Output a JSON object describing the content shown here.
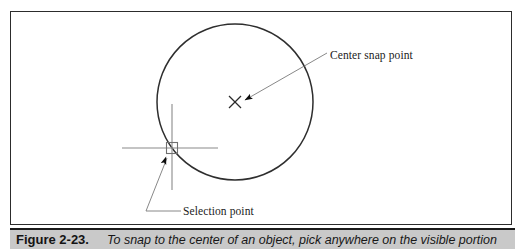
{
  "figure": {
    "frame": {
      "border_color": "#2c2c2c",
      "background": "#ffffff"
    },
    "annotations": {
      "center_snap_label": "Center snap point",
      "selection_label": "Selection point"
    },
    "drawing": {
      "circle": {
        "center_x": 235,
        "center_y": 102,
        "radius": 78,
        "stroke": "#2e2e2e"
      },
      "center_marker": {
        "type": "x-marker",
        "x": 235,
        "y": 102,
        "size": 11
      },
      "crosshair": {
        "x": 172,
        "y": 148,
        "vertical_top": 104,
        "vertical_bottom": 190,
        "horizontal_left": 122,
        "horizontal_right": 218,
        "stroke": "#7d7d7d"
      },
      "pick_box": {
        "x": 167,
        "y": 143,
        "size": 11,
        "stroke": "#6f6f6f"
      },
      "leader_center": {
        "from_x": 327,
        "from_y": 53,
        "to_x": 243,
        "to_y": 100
      },
      "leader_selection": {
        "from_x": 180,
        "from_y": 211,
        "mid_x": 145,
        "mid_y": 211,
        "to_x": 166,
        "to_y": 157
      }
    }
  },
  "caption": {
    "number": "Figure 2-23.",
    "text": "To snap to the center of an object, pick anywhere on the visible portion",
    "background": "#c9c9c9"
  }
}
